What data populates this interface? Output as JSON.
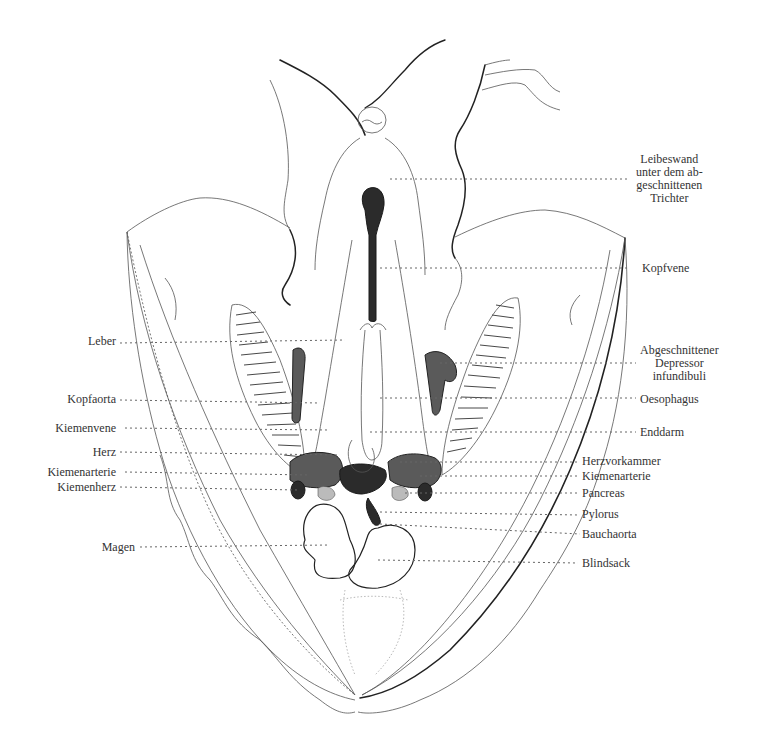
{
  "figure": {
    "labels_right": [
      {
        "id": "leibeswand",
        "lines": [
          "Leibeswand",
          "unter dem ab-",
          "geschnittenen",
          "Trichter"
        ]
      },
      {
        "id": "kopfvene",
        "lines": [
          "Kopfvene"
        ]
      },
      {
        "id": "depressor",
        "lines": [
          "Abgeschnittener",
          "Depressor",
          "infundibuli"
        ]
      },
      {
        "id": "oesophagus",
        "lines": [
          "Oesophagus"
        ]
      },
      {
        "id": "enddarm",
        "lines": [
          "Enddarm"
        ]
      },
      {
        "id": "herzvorkammer",
        "lines": [
          "Herzvorkammer"
        ]
      },
      {
        "id": "kiemenarterie-r",
        "lines": [
          "Kiemenarterie"
        ]
      },
      {
        "id": "pancreas",
        "lines": [
          "Pancreas"
        ]
      },
      {
        "id": "pylorus",
        "lines": [
          "Pylorus"
        ]
      },
      {
        "id": "bauchaorta",
        "lines": [
          "Bauchaorta"
        ]
      },
      {
        "id": "blindsack",
        "lines": [
          "Blindsack"
        ]
      }
    ],
    "labels_left": [
      {
        "id": "leber",
        "lines": [
          "Leber"
        ]
      },
      {
        "id": "kopfaorta",
        "lines": [
          "Kopfaorta"
        ]
      },
      {
        "id": "kiemenvene",
        "lines": [
          "Kiemenvene"
        ]
      },
      {
        "id": "herz",
        "lines": [
          "Herz"
        ]
      },
      {
        "id": "kiemenarterie-l",
        "lines": [
          "Kiemenarterie"
        ]
      },
      {
        "id": "kiemenherz",
        "lines": [
          "Kiemenherz"
        ]
      },
      {
        "id": "magen",
        "lines": [
          "Magen"
        ]
      }
    ]
  },
  "text": {
    "leibeswand_1": "Leibeswand",
    "leibeswand_2": "unter dem ab-",
    "leibeswand_3": "geschnittenen",
    "leibeswand_4": "Trichter",
    "kopfvene": "Kopfvene",
    "depressor_1": "Abgeschnittener",
    "depressor_2": "Depressor",
    "depressor_3": "infundibuli",
    "oesophagus": "Oesophagus",
    "enddarm": "Enddarm",
    "herzvorkammer": "Herzvorkammer",
    "kiemenarterie_r": "Kiemenarterie",
    "pancreas": "Pancreas",
    "pylorus": "Pylorus",
    "bauchaorta": "Bauchaorta",
    "blindsack": "Blindsack",
    "leber": "Leber",
    "kopfaorta": "Kopfaorta",
    "kiemenvene": "Kiemenvene",
    "herz": "Herz",
    "kiemenarterie_l": "Kiemenarterie",
    "kiemenherz": "Kiemenherz",
    "magen": "Magen"
  }
}
